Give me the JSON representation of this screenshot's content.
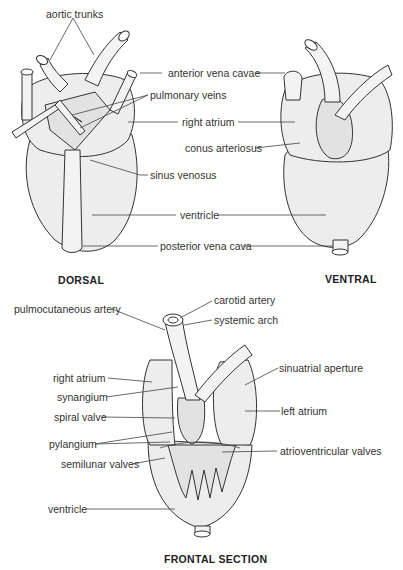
{
  "figure": {
    "views": {
      "dorsal": {
        "caption": "DORSAL",
        "labels": {
          "aortic_trunks": "aortic trunks",
          "pulmonary_veins": "pulmonary veins",
          "sinus_venosus": "sinus venosus"
        }
      },
      "ventral": {
        "caption": "VENTRAL",
        "labels": {
          "conus_arteriosus": "conus arteriosus"
        }
      },
      "shared_labels": {
        "anterior_vena_cavae": "anterior vena cavae",
        "right_atrium": "right atrium",
        "ventricle": "ventricle",
        "posterior_vena_cava": "posterior vena cava"
      },
      "frontal_section": {
        "caption": "FRONTAL SECTION",
        "labels": {
          "carotid_artery": "carotid artery",
          "pulmocutaneous_artery": "pulmocutaneous artery",
          "systemic_arch": "systemic arch",
          "sinuatrial_aperture": "sinuatrial aperture",
          "right_atrium": "right atrium",
          "synangium": "synangium",
          "spiral_valve": "spiral valve",
          "left_atrium": "left atrium",
          "pylangium": "pylangium",
          "atrioventricular_valves": "atrioventricular valves",
          "semilunar_valves": "semilunar valves",
          "ventricle": "ventricle"
        }
      }
    }
  }
}
